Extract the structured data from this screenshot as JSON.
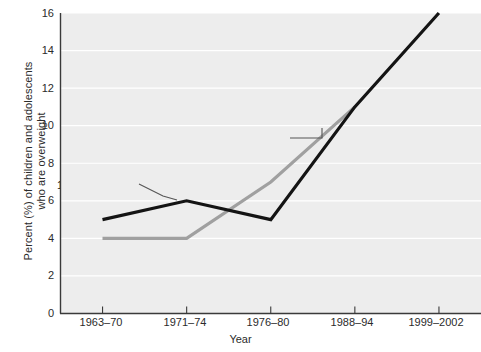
{
  "chart_data": {
    "type": "line",
    "title": "",
    "xlabel": "Year",
    "ylabel": "Percent (%) of children and adolescents\nwho are overweight",
    "categories": [
      "1963–70",
      "1971–74",
      "1976–80",
      "1988–94",
      "1999–2002"
    ],
    "ylim": [
      0,
      16
    ],
    "yticks": [
      0,
      2,
      4,
      6,
      8,
      10,
      12,
      14,
      16
    ],
    "ytick_labels": [
      "0",
      "2",
      "4",
      "6",
      "8",
      "10",
      "12",
      "14",
      "16"
    ],
    "grid": true,
    "grid_axis": "y",
    "legend_position": "inline-annotations",
    "plot_background": "#ededed",
    "gridline_color": "#ffffff",
    "series": [
      {
        "name": "12–19 years old",
        "color": "#141414",
        "values": [
          5,
          6,
          5,
          11,
          16
        ],
        "label_text": "12–19 years old",
        "label_x": 57,
        "label_y": 185
      },
      {
        "name": "6–11 years old",
        "color": "#a0a0a0",
        "values": [
          4,
          4,
          7,
          11,
          null
        ],
        "label_text": "6–11 years old",
        "label_x": 209,
        "label_y": 132
      }
    ]
  },
  "axes": {
    "y_title_line1": "Percent (%) of children and adolescents",
    "y_title_line2": "who are overweight",
    "x_title": "Year",
    "y_tick_0": "0",
    "y_tick_2": "2",
    "y_tick_4": "4",
    "y_tick_6": "6",
    "y_tick_8": "8",
    "y_tick_10": "10",
    "y_tick_12": "12",
    "y_tick_14": "14",
    "y_tick_16": "16",
    "x_tick_0": "1963–70",
    "x_tick_1": "1971–74",
    "x_tick_2": "1976–80",
    "x_tick_3": "1988–94",
    "x_tick_4": "1999–2002"
  },
  "annotations": {
    "series_black_label": "12–19 years old",
    "series_gray_label": "6–11 years old"
  },
  "colors": {
    "line_black": "#141414",
    "line_gray": "#a0a0a0",
    "plot_bg": "#ededed",
    "gridline": "#ffffff",
    "axis": "#3a3a3a",
    "text": "#2b2b2b"
  }
}
